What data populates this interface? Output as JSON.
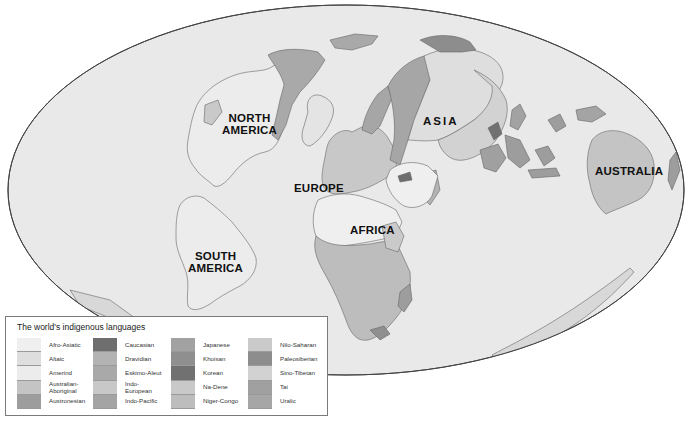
{
  "map": {
    "projection": "elliptical world map",
    "ocean_color": "#e9e9e9",
    "border_color": "#555555",
    "continent_labels": [
      {
        "id": "north-america",
        "text": "NORTH\nAMERICA",
        "x": 220,
        "y": 115
      },
      {
        "id": "asia",
        "text": "ASIA",
        "x": 423,
        "y": 115
      },
      {
        "id": "europe",
        "text": "EUROPE",
        "x": 295,
        "y": 183
      },
      {
        "id": "africa",
        "text": "AFRICA",
        "x": 350,
        "y": 226
      },
      {
        "id": "south-america",
        "text": "SOUTH\nAMERICA",
        "x": 189,
        "y": 252
      },
      {
        "id": "australia",
        "text": "AUSTRALIA",
        "x": 596,
        "y": 165
      }
    ]
  },
  "legend": {
    "title": "The world's indigenous languages",
    "columns": [
      [
        {
          "label": "Afro-Asiatic",
          "color": "#efefef"
        },
        {
          "label": "Altaic",
          "color": "#dedede"
        },
        {
          "label": "Amerind",
          "color": "#ececec"
        },
        {
          "label": "Australian-\nAboriginal",
          "color": "#c4c4c4"
        },
        {
          "label": "Austronesian",
          "color": "#9d9d9d"
        }
      ],
      [
        {
          "label": "Caucasian",
          "color": "#6e6e6e"
        },
        {
          "label": "Dravidian",
          "color": "#b3b3b3"
        },
        {
          "label": "Eskimo-Aleut",
          "color": "#a9a9a9"
        },
        {
          "label": "Indo-\nEuropean",
          "color": "#c8c8c8"
        },
        {
          "label": "Indo-Pacific",
          "color": "#a4a4a4"
        }
      ],
      [
        {
          "label": "Japanese",
          "color": "#a2a2a2"
        },
        {
          "label": "Khoisan",
          "color": "#8f8f8f"
        },
        {
          "label": "Korean",
          "color": "#717171"
        },
        {
          "label": "Na-Dene",
          "color": "#c9c9c9"
        },
        {
          "label": "Niger-Congo",
          "color": "#bdbdbd"
        }
      ],
      [
        {
          "label": "Nilo-Saharan",
          "color": "#cacaca"
        },
        {
          "label": "Paleosiberian",
          "color": "#8d8d8d"
        },
        {
          "label": "Sino-Tibetan",
          "color": "#d2d2d2"
        },
        {
          "label": "Tai",
          "color": "#a0a0a0"
        },
        {
          "label": "Uralic",
          "color": "#a6a6a6"
        }
      ]
    ]
  }
}
